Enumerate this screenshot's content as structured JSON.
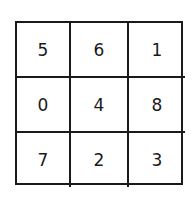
{
  "grid": {
    "rows": 3,
    "cols": 3,
    "cells": [
      [
        "5",
        "6",
        "1"
      ],
      [
        "0",
        "4",
        "8"
      ],
      [
        "7",
        "2",
        "3"
      ]
    ]
  },
  "colors": {
    "line": "#1a1a1a",
    "background": "#ffffff",
    "text": "#1a1a1a"
  }
}
